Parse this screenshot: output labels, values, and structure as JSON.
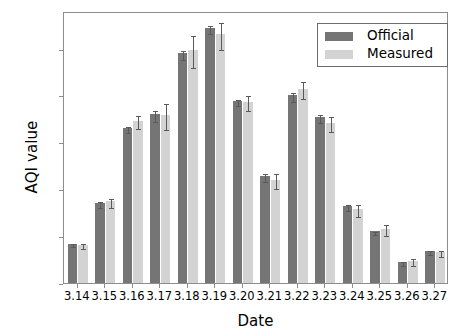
{
  "chart_data": {
    "type": "bar",
    "title": "",
    "xlabel": "Date",
    "ylabel": "AQI value",
    "categories": [
      "3.14",
      "3.15",
      "3.16",
      "3.17",
      "3.18",
      "3.19",
      "3.20",
      "3.21",
      "3.22",
      "3.23",
      "3.24",
      "3.25",
      "3.26",
      "3.27"
    ],
    "series": [
      {
        "name": "Official",
        "color": "#757575",
        "values": [
          42,
          85,
          165,
          180,
          245,
          272,
          194,
          114,
          200,
          177,
          82,
          55,
          22,
          34
        ],
        "errors": [
          2,
          3,
          3,
          6,
          5,
          4,
          3,
          4,
          5,
          4,
          3,
          2,
          2,
          2
        ]
      },
      {
        "name": "Measured",
        "color": "#d3d3d3",
        "values": [
          41,
          87,
          173,
          179,
          248,
          265,
          193,
          110,
          207,
          171,
          79,
          58,
          24,
          33
        ],
        "errors": [
          3,
          5,
          7,
          14,
          17,
          14,
          8,
          8,
          9,
          8,
          6,
          6,
          4,
          3
        ]
      }
    ],
    "ylim": [
      0,
      290
    ],
    "yticks": [
      0,
      50,
      100,
      150,
      200,
      250
    ],
    "ytick_labels": [
      "0",
      "50",
      "100",
      "150",
      "200",
      "250"
    ],
    "grid": false,
    "legend_position": "upper right",
    "legend_entries": [
      "Official",
      "Measured"
    ]
  }
}
